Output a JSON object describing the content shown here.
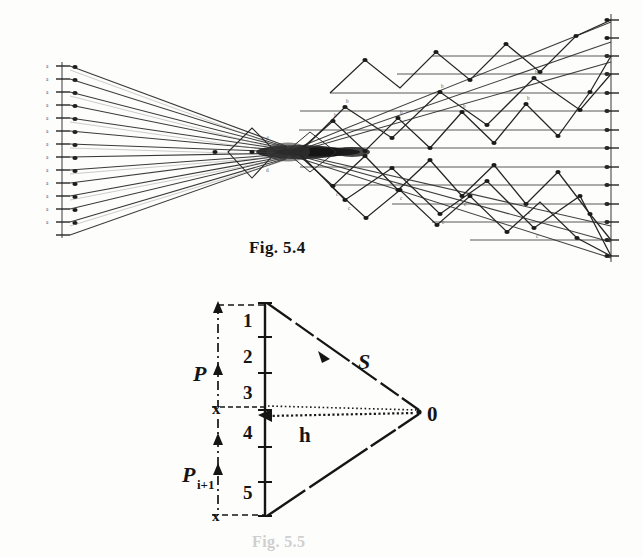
{
  "page": {
    "background_color": "#fdfdfc",
    "ink_color": "#1a1a1a",
    "width": 643,
    "height": 557,
    "media": "scanned-book-page"
  },
  "figures": [
    {
      "id": "fig-5-4",
      "caption": "Fig. 5.4",
      "type": "ray-crossing-diagram",
      "description": "Fan of converging rays from a left vertical axis crossing at a central waist and diverging into upper and lower zig-zag ray bundles toward a right vertical axis",
      "left_axis": {
        "tick_count": 14,
        "x": 62,
        "y_top": 64,
        "y_bottom": 236,
        "point_labels": [
          "a1",
          "a2",
          "a3",
          "a4",
          "a5",
          "a6",
          "a7",
          "a8",
          "a9",
          "a10",
          "a11",
          "a12",
          "a13",
          "a14"
        ]
      },
      "right_axis": {
        "tick_count": 14,
        "x": 611,
        "y_top": 16,
        "y_bottom": 258,
        "point_labels": [
          "b1",
          "b2",
          "b3",
          "b4",
          "b5",
          "b6",
          "b7",
          "b8",
          "b9",
          "b10",
          "b11",
          "b12",
          "b13",
          "b14"
        ]
      },
      "crossing_waist": {
        "x": 290,
        "y": 152
      }
    },
    {
      "id": "fig-5-5",
      "caption": "Fig. 5.5",
      "type": "geometry-triangle-diagram",
      "description": "Triangle formed by an apex point O at the right and a vertical segment at the left divided into five numbered intervals; brace P spans intervals 1-3 and brace P i+1 spans intervals 4-5; S labels the upper slant side and h the horizontal distance from the vertical line to O",
      "vertical_segment": {
        "x": 265,
        "y_top": 303,
        "y_bottom": 516,
        "interval_labels": [
          "1",
          "2",
          "3",
          "4",
          "5"
        ]
      },
      "apex": {
        "label": "0",
        "x": 419,
        "y": 412
      },
      "braces": [
        {
          "label": "P",
          "spans_intervals": [
            "1",
            "2",
            "3"
          ]
        },
        {
          "label": "Pi+1",
          "label_base": "P",
          "label_sub": "i+1",
          "spans_intervals": [
            "4",
            "5"
          ]
        }
      ],
      "side_label": "S",
      "height_label": "h",
      "axis_marker": "x"
    }
  ]
}
